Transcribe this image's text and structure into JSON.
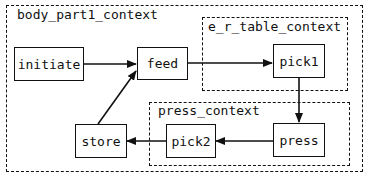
{
  "contexts": {
    "outer": {
      "label": "body_part1_context"
    },
    "er_table": {
      "label": "e_r_table_context"
    },
    "press": {
      "label": "press_context"
    }
  },
  "nodes": {
    "initiate": {
      "label": "initiate"
    },
    "feed": {
      "label": "feed"
    },
    "pick1": {
      "label": "pick1"
    },
    "press": {
      "label": "press"
    },
    "pick2": {
      "label": "pick2"
    },
    "store": {
      "label": "store"
    }
  },
  "edges": [
    {
      "from": "initiate",
      "to": "feed"
    },
    {
      "from": "feed",
      "to": "pick1"
    },
    {
      "from": "pick1",
      "to": "press"
    },
    {
      "from": "press",
      "to": "pick2"
    },
    {
      "from": "pick2",
      "to": "store"
    },
    {
      "from": "store",
      "to": "feed"
    }
  ],
  "colors": {
    "stroke": "#111111",
    "background": "#ffffff"
  }
}
